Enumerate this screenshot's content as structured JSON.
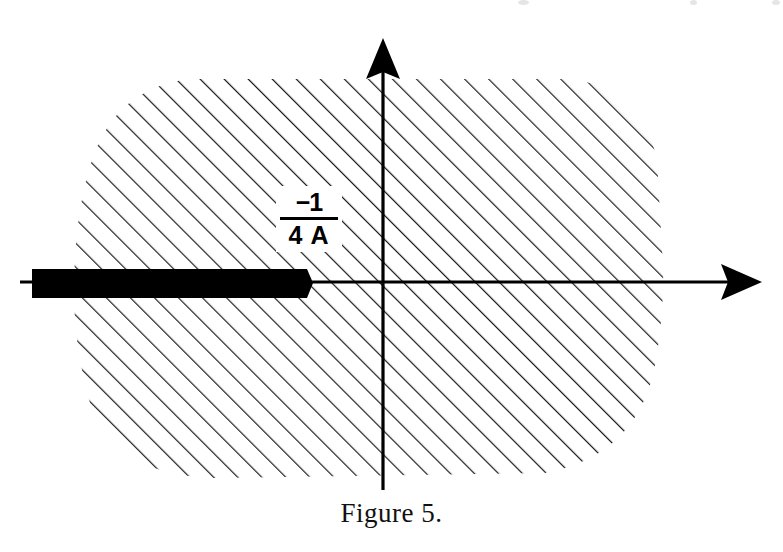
{
  "figure": {
    "caption": "Figure 5.",
    "label": {
      "numerator": "−1",
      "denominator": "4 A",
      "full_text": "−1 / 4 A"
    },
    "colors": {
      "ink": "#000000",
      "background": "#ffffff",
      "hatch": "#1a1a1a"
    },
    "axes": {
      "origin": {
        "x": 383,
        "y": 282
      },
      "horizontal_arrow_tip": {
        "x": 762,
        "y": 282
      },
      "vertical_arrow_tip": {
        "x": 383,
        "y": 38
      },
      "horizontal_label": "",
      "vertical_label": ""
    },
    "branch_cut": {
      "description": "thick black bar on negative real axis",
      "x_start": 32,
      "x_end": 313,
      "y_top": 269,
      "y_bottom": 298
    },
    "hatched_region": {
      "description": "rounded blob of 45-degree hatching",
      "hatch_angle_deg": 45,
      "hatch_spacing_px": 17,
      "bounds": {
        "left": 74,
        "top": 78,
        "right": 664,
        "bottom": 480
      }
    }
  }
}
